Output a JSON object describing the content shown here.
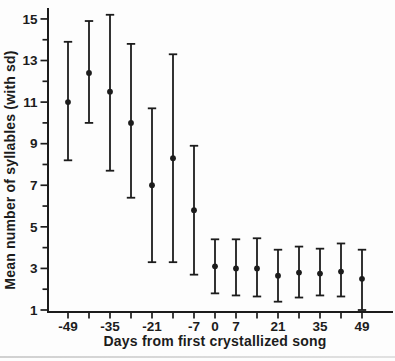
{
  "figure": {
    "background": "#fdfdfd",
    "ink_color": "#1c1c1c",
    "bottom_rule_color": "#c8c8c8"
  },
  "chart_data": {
    "type": "scatter",
    "subtype": "means-with-sd-error-bars",
    "title": "",
    "xlabel": "Days from first crystallized song",
    "ylabel": "Mean number of syllables (with sd)",
    "marker": "filled-circle",
    "error_caps": true,
    "grid": false,
    "legend": "none",
    "xlim": [
      -56,
      59
    ],
    "ylim": [
      0.9,
      15.6
    ],
    "x_ticks": [
      -49,
      -42,
      -35,
      -28,
      -21,
      -14,
      -7,
      0,
      7,
      14,
      21,
      28,
      35,
      42,
      49
    ],
    "x_labeled_ticks": [
      -49,
      -35,
      -21,
      -7,
      0,
      7,
      21,
      35,
      49
    ],
    "x_tick_labels": [
      "-49",
      "-35",
      "-21",
      "-7",
      "0",
      "7",
      "21",
      "35",
      "49"
    ],
    "y_ticks": [
      1,
      2,
      3,
      4,
      5,
      6,
      7,
      8,
      9,
      10,
      11,
      12,
      13,
      14,
      15
    ],
    "y_labeled_ticks": [
      1,
      3,
      5,
      7,
      9,
      11,
      13,
      15
    ],
    "y_tick_labels": [
      "1",
      "3",
      "5",
      "7",
      "9",
      "11",
      "13",
      "15"
    ],
    "series": [
      {
        "name": "mean number of syllables",
        "points": [
          {
            "day": -49,
            "mean": 11.0,
            "lo": 8.2,
            "hi": 13.9
          },
          {
            "day": -42,
            "mean": 12.4,
            "lo": 10.0,
            "hi": 14.9
          },
          {
            "day": -35,
            "mean": 11.5,
            "lo": 7.7,
            "hi": 15.2
          },
          {
            "day": -28,
            "mean": 10.0,
            "lo": 6.4,
            "hi": 13.8
          },
          {
            "day": -21,
            "mean": 7.0,
            "lo": 3.3,
            "hi": 10.7
          },
          {
            "day": -14,
            "mean": 8.3,
            "lo": 3.3,
            "hi": 13.3
          },
          {
            "day": -7,
            "mean": 5.8,
            "lo": 2.7,
            "hi": 8.9
          },
          {
            "day": 0,
            "mean": 3.1,
            "lo": 1.8,
            "hi": 4.4
          },
          {
            "day": 7,
            "mean": 3.0,
            "lo": 1.7,
            "hi": 4.4
          },
          {
            "day": 14,
            "mean": 3.0,
            "lo": 1.65,
            "hi": 4.45
          },
          {
            "day": 21,
            "mean": 2.65,
            "lo": 1.4,
            "hi": 3.9
          },
          {
            "day": 28,
            "mean": 2.8,
            "lo": 1.6,
            "hi": 4.05
          },
          {
            "day": 35,
            "mean": 2.75,
            "lo": 1.7,
            "hi": 3.95
          },
          {
            "day": 42,
            "mean": 2.85,
            "lo": 1.65,
            "hi": 4.2
          },
          {
            "day": 49,
            "mean": 2.5,
            "lo": 1.0,
            "hi": 3.9
          }
        ]
      }
    ]
  }
}
